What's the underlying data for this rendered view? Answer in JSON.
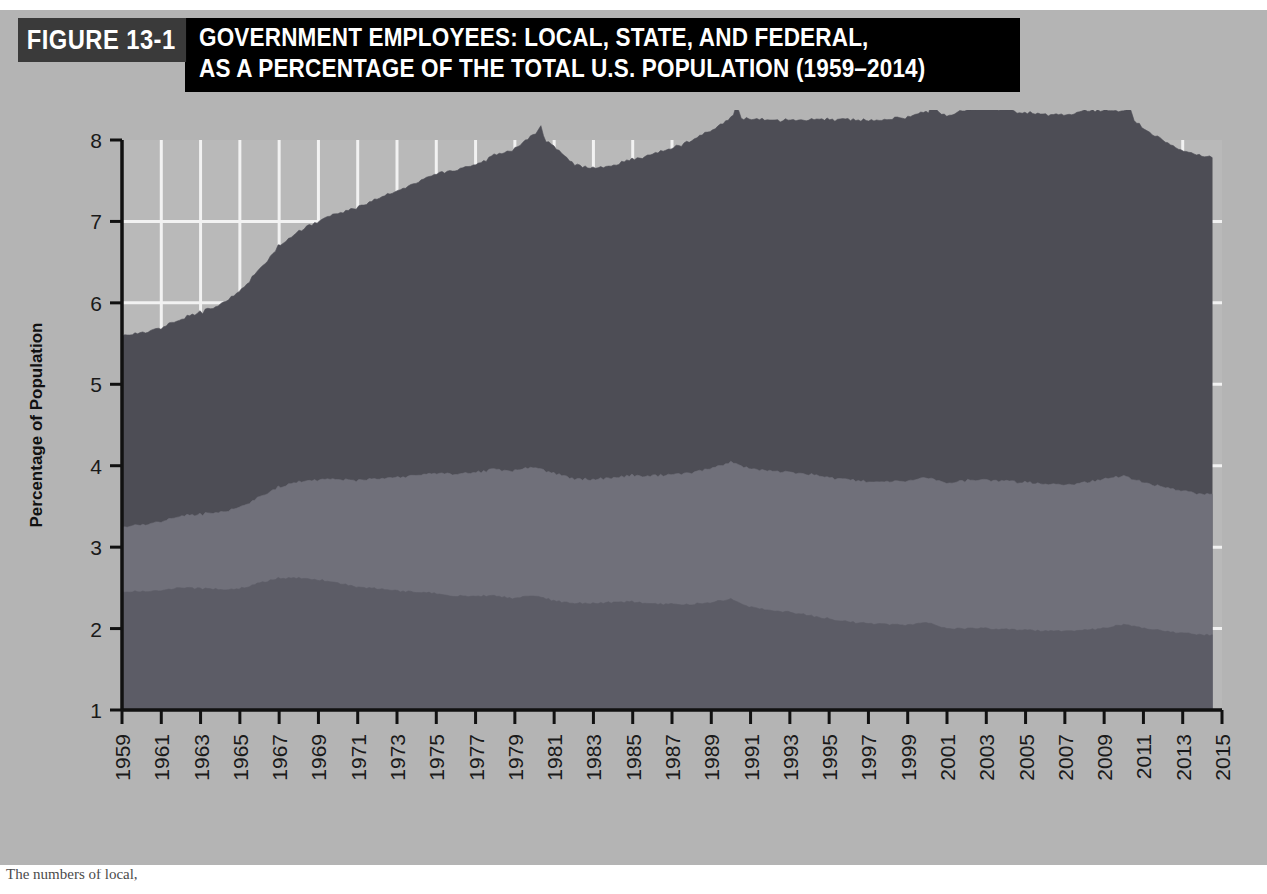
{
  "figure": {
    "label": "FIGURE 13-1",
    "title_line_1": "GOVERNMENT EMPLOYEES: LOCAL, STATE, AND FEDERAL,",
    "title_line_2": "AS A PERCENTAGE OF THE TOTAL U.S. POPULATION (1959–2014)",
    "caption": "The numbers of local,"
  },
  "colors": {
    "page_background": "#ffffff",
    "panel_background": "#b4b4b4",
    "plot_background": "#b9b9b9",
    "gridline": "#f2f2f2",
    "axis": "#111111",
    "banner_label": "#3a3a3a",
    "banner_title": "#000000",
    "local": "#4d4d55",
    "state": "#70707a",
    "federal": "#5c5c66"
  },
  "chart_data": {
    "type": "area",
    "stacked": true,
    "title": "Government Employees: Local, State, and Federal, as a Percentage of the Total U.S. Population (1959–2014)",
    "xlabel": "Date",
    "ylabel": "Percentage of Population",
    "xlim": [
      1959,
      2015
    ],
    "ylim": [
      1,
      8
    ],
    "yticks": [
      1,
      2,
      3,
      4,
      5,
      6,
      7,
      8
    ],
    "xticks": [
      1959,
      1961,
      1963,
      1965,
      1967,
      1969,
      1971,
      1973,
      1975,
      1977,
      1979,
      1981,
      1983,
      1985,
      1987,
      1989,
      1991,
      1993,
      1995,
      1997,
      1999,
      2001,
      2003,
      2005,
      2007,
      2009,
      2011,
      2013,
      2015
    ],
    "grid": true,
    "legend_position": "bottom",
    "data_end_x": 2014.5,
    "x": [
      1959,
      1960,
      1961,
      1962,
      1963,
      1964,
      1965,
      1966,
      1967,
      1968,
      1969,
      1970,
      1971,
      1972,
      1973,
      1974,
      1975,
      1976,
      1977,
      1978,
      1979,
      1980,
      1981,
      1982,
      1983,
      1984,
      1985,
      1986,
      1987,
      1988,
      1989,
      1990,
      1991,
      1992,
      1993,
      1994,
      1995,
      1996,
      1997,
      1998,
      1999,
      2000,
      2001,
      2002,
      2003,
      2004,
      2005,
      2006,
      2007,
      2008,
      2009,
      2010,
      2011,
      2012,
      2013,
      2014.5
    ],
    "series": [
      {
        "name": "Federal",
        "stack_order": 1,
        "color": "#5c5c66",
        "values": [
          1.45,
          1.46,
          1.47,
          1.5,
          1.49,
          1.48,
          1.49,
          1.56,
          1.62,
          1.62,
          1.6,
          1.56,
          1.51,
          1.49,
          1.46,
          1.45,
          1.43,
          1.4,
          1.4,
          1.4,
          1.37,
          1.41,
          1.34,
          1.31,
          1.31,
          1.32,
          1.33,
          1.3,
          1.3,
          1.3,
          1.32,
          1.36,
          1.26,
          1.23,
          1.2,
          1.16,
          1.12,
          1.08,
          1.06,
          1.05,
          1.04,
          1.07,
          1.0,
          1.0,
          1.0,
          0.99,
          0.98,
          0.97,
          0.97,
          0.98,
          1.0,
          1.05,
          1.0,
          0.97,
          0.94,
          0.92
        ]
      },
      {
        "name": "State",
        "stack_order": 2,
        "color": "#70707a",
        "values": [
          0.8,
          0.82,
          0.85,
          0.88,
          0.91,
          0.95,
          1.0,
          1.06,
          1.12,
          1.18,
          1.23,
          1.27,
          1.31,
          1.35,
          1.39,
          1.44,
          1.48,
          1.5,
          1.52,
          1.55,
          1.57,
          1.58,
          1.56,
          1.53,
          1.52,
          1.53,
          1.55,
          1.57,
          1.59,
          1.62,
          1.65,
          1.68,
          1.7,
          1.71,
          1.72,
          1.73,
          1.74,
          1.74,
          1.74,
          1.75,
          1.76,
          1.78,
          1.79,
          1.82,
          1.83,
          1.82,
          1.81,
          1.8,
          1.8,
          1.81,
          1.83,
          1.82,
          1.79,
          1.76,
          1.74,
          1.73
        ]
      },
      {
        "name": "Local",
        "stack_order": 3,
        "color": "#4d4d55",
        "values": [
          2.35,
          2.36,
          2.38,
          2.42,
          2.48,
          2.55,
          2.66,
          2.8,
          2.96,
          3.08,
          3.18,
          3.27,
          3.36,
          3.44,
          3.52,
          3.6,
          3.68,
          3.74,
          3.78,
          3.86,
          3.95,
          4.1,
          4.02,
          3.86,
          3.82,
          3.84,
          3.89,
          3.95,
          4.01,
          4.08,
          4.15,
          4.24,
          4.3,
          4.31,
          4.32,
          4.36,
          4.4,
          4.42,
          4.44,
          4.45,
          4.47,
          4.5,
          4.52,
          4.55,
          4.58,
          4.56,
          4.54,
          4.54,
          4.55,
          4.56,
          4.53,
          4.48,
          4.35,
          4.26,
          4.18,
          4.14
        ]
      }
    ],
    "annotations": [
      {
        "label": "1980 census spike",
        "x": 1980.3,
        "y": 7.26
      },
      {
        "label": "1990 census spike",
        "x": 1990.3,
        "y": 7.33
      },
      {
        "label": "2000 census spike",
        "x": 2000.3,
        "y": 7.28
      },
      {
        "label": "2010 census spike",
        "x": 2010.3,
        "y": 7.24
      }
    ]
  },
  "legend": [
    {
      "key": "local",
      "label": "Local",
      "color": "#6e6e74"
    },
    {
      "key": "state",
      "label": "State",
      "color": "#7e7e84"
    },
    {
      "key": "federal",
      "label": "Federal",
      "color": "#5e5e66"
    }
  ]
}
